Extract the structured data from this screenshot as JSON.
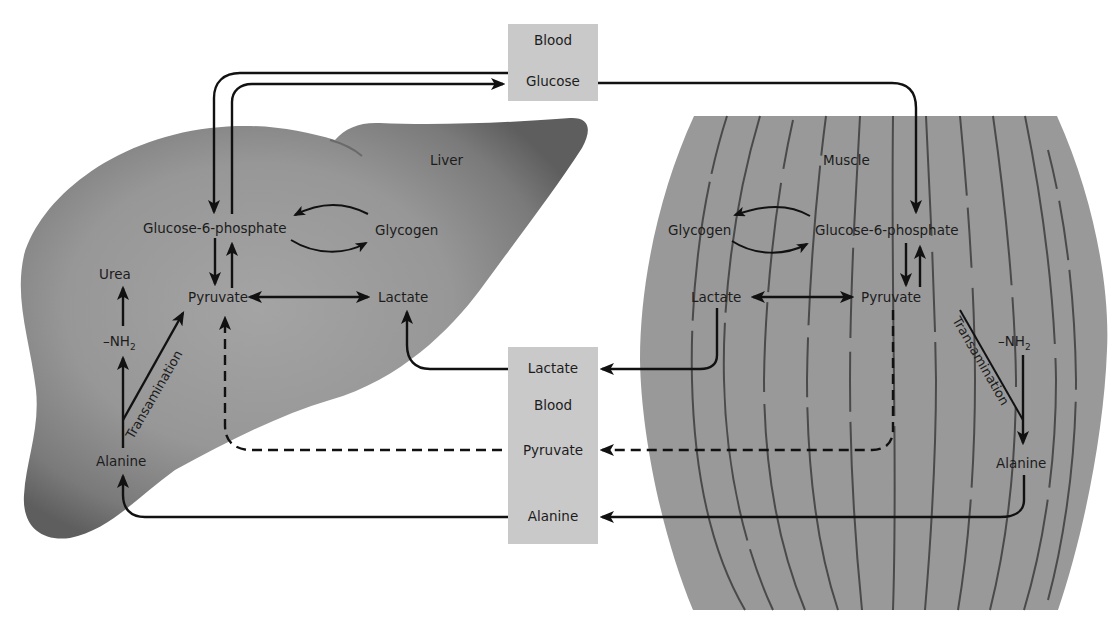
{
  "diagram": {
    "blood_top": {
      "header": "Blood",
      "glucose": "Glucose"
    },
    "blood_bottom": {
      "lactate": "Lactate",
      "header": "Blood",
      "pyruvate": "Pyruvate",
      "alanine": "Alanine"
    },
    "liver": {
      "name": "Liver",
      "glucose6p": "Glucose-6-phosphate",
      "glycogen": "Glycogen",
      "urea": "Urea",
      "pyruvate": "Pyruvate",
      "lactate": "Lactate",
      "nh2": "–NH",
      "nh2_sub": "2",
      "transamination": "Transamination",
      "alanine": "Alanine"
    },
    "muscle": {
      "name": "Muscle",
      "glycogen": "Glycogen",
      "glucose6p": "Glucose-6-phosphate",
      "lactate": "Lactate",
      "pyruvate": "Pyruvate",
      "nh2": "–NH",
      "nh2_sub": "2",
      "transamination": "Transamination",
      "alanine": "Alanine"
    },
    "colors": {
      "liver_fill": "#8a8a8a",
      "liver_edge": "#5a5a5a",
      "muscle_fill": "#999999",
      "blood_box": "#c9c9c9",
      "arrow": "#111111"
    }
  }
}
